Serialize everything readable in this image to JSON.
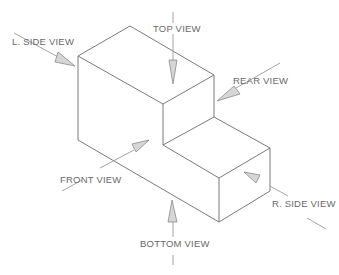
{
  "diagram": {
    "type": "isometric-orthographic-views",
    "object": "stepped block",
    "labels": {
      "left_side": "L. SIDE VIEW",
      "top": "TOP VIEW",
      "rear": "REAR VIEW",
      "front": "FRONT VIEW",
      "right_side": "R. SIDE VIEW",
      "bottom": "BOTTOM VIEW"
    },
    "colors": {
      "line": "#7a7a7a",
      "arrow_fill": "#d6d6d6",
      "text": "#6a6a6a",
      "background": "#ffffff"
    }
  }
}
